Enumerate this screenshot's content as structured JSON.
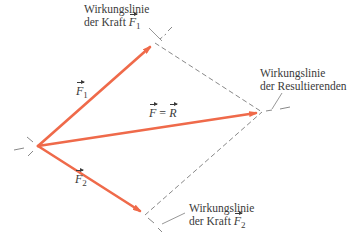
{
  "diagram": {
    "colors": {
      "force_arrow": "#ef6a4a",
      "dashed_line": "#6a6a6a",
      "text": "#3a3a3a",
      "background": "#ffffff"
    },
    "points": {
      "origin": [
        38,
        146
      ],
      "F1_tip": [
        155,
        43
      ],
      "F2_tip": [
        145,
        215
      ],
      "R_tip": [
        262,
        112
      ]
    },
    "vectors": {
      "F1": {
        "symbol": "F",
        "subscript": "1"
      },
      "F2": {
        "symbol": "F",
        "subscript": "2"
      },
      "R": {
        "left_symbol": "F",
        "equals": "=",
        "right_symbol": "R"
      }
    },
    "labels": {
      "line_F1": {
        "line1": "Wirkungslinie",
        "line2_prefix": "der Kraft",
        "symbol": "F",
        "subscript": "1"
      },
      "line_R": {
        "line1": "Wirkungslinie",
        "line2": "der Resultierenden"
      },
      "line_F2": {
        "line1": "Wirkungslinie",
        "line2_prefix": "der Kraft",
        "symbol": "F",
        "subscript": "2"
      }
    }
  }
}
